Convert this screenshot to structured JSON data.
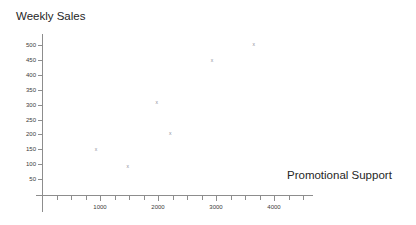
{
  "chart_data": {
    "type": "scatter",
    "title": "Weekly Sales",
    "xlabel": "Promotional Support",
    "ylabel": "Weekly Sales",
    "marker": "x",
    "grid": false,
    "legend": null,
    "xlim": [
      0,
      4650
    ],
    "ylim": [
      0,
      530
    ],
    "xticks": [
      0,
      250,
      500,
      750,
      1000,
      1250,
      1500,
      1750,
      2000,
      2250,
      2500,
      2750,
      3000,
      3250,
      3500,
      3750,
      4000,
      4250,
      4500
    ],
    "xtick_labels": [
      "1000",
      "2000",
      "3000",
      "4000"
    ],
    "xtick_label_values": [
      1000,
      2000,
      3000,
      4000
    ],
    "yticks": [
      50,
      100,
      150,
      200,
      250,
      300,
      350,
      400,
      450,
      500
    ],
    "ytick_labels": [
      "50",
      "100",
      "150",
      "200",
      "250",
      "300",
      "350",
      "400",
      "450",
      "500"
    ],
    "points": [
      {
        "x": 930,
        "y": 150
      },
      {
        "x": 1480,
        "y": 95
      },
      {
        "x": 1980,
        "y": 310
      },
      {
        "x": 2210,
        "y": 205
      },
      {
        "x": 2930,
        "y": 450
      },
      {
        "x": 3650,
        "y": 505
      }
    ],
    "colors": {
      "axis": "#8d8d8d",
      "marker": "#8e8e9a",
      "text": "#262626",
      "background": "#ffffff"
    }
  }
}
